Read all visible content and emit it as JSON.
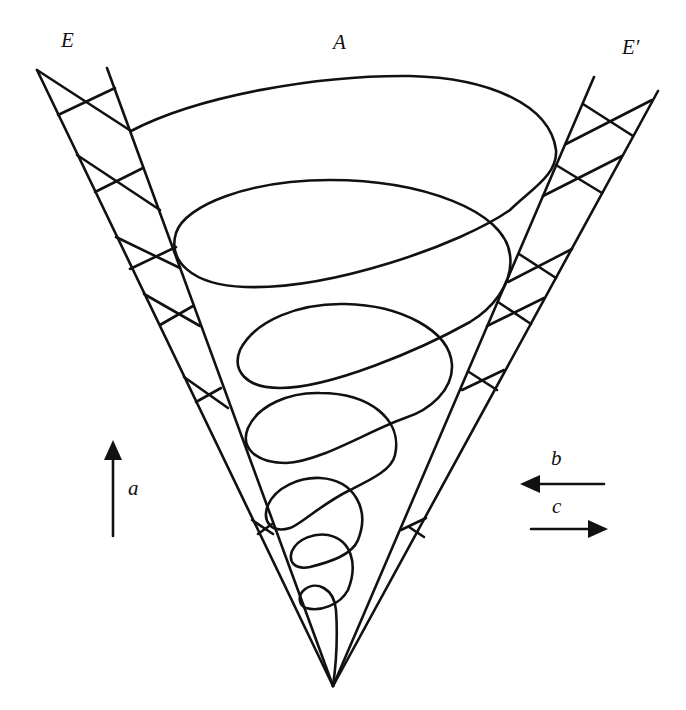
{
  "figure": {
    "line_color": "#111111",
    "background": "#ffffff"
  },
  "labels": {
    "left_wall": "E",
    "axis_top": "A",
    "right_wall": "E′",
    "arrow_up": "a",
    "arrow_left": "b",
    "arrow_right": "c"
  },
  "arrows": [
    {
      "id": "a",
      "direction": "up"
    },
    {
      "id": "b",
      "direction": "left"
    },
    {
      "id": "c",
      "direction": "right"
    }
  ],
  "spiral": {
    "turns": 6
  }
}
